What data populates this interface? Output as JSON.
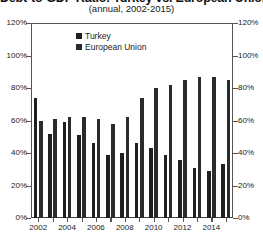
{
  "chart_data": {
    "type": "bar",
    "title": "Debt-to-GDP Ratio: Turkey vs. European Union",
    "subtitle": "(annual, 2002-2015)",
    "xlabel": "",
    "ylabel": "",
    "ylim": [
      0,
      120
    ],
    "ytick_labels": [
      "0%",
      "20%",
      "40%",
      "60%",
      "80%",
      "100%",
      "120%"
    ],
    "ytick_values": [
      0,
      20,
      40,
      60,
      80,
      100,
      120
    ],
    "ytick_labels_right": [
      "0%",
      "20%",
      "40%",
      "60%",
      "80%",
      "100%",
      "120%"
    ],
    "dual_axis": true,
    "grid": false,
    "legend_position": "top-center-inside",
    "categories": [
      "2002",
      "2003",
      "2004",
      "2005",
      "2006",
      "2007",
      "2008",
      "2009",
      "2010",
      "2011",
      "2012",
      "2013",
      "2014",
      "2015"
    ],
    "xtick_labels": [
      "2002",
      "2004",
      "2006",
      "2008",
      "2010",
      "2012",
      "2014"
    ],
    "series": [
      {
        "name": "Turkey",
        "color": "#1f1f1f",
        "values": [
          74,
          52,
          59,
          51,
          46,
          39,
          40,
          46,
          43,
          39,
          36,
          31,
          29,
          33
        ]
      },
      {
        "name": "European Union",
        "color": "#2b2b2b",
        "values": [
          60,
          61,
          62,
          62,
          61,
          58,
          62,
          74,
          80,
          82,
          85,
          87,
          87,
          85
        ]
      }
    ]
  },
  "legend": {
    "items": [
      {
        "label": "Turkey",
        "color": "#1f1f1f"
      },
      {
        "label": "European Union",
        "color": "#2b2b2b"
      }
    ]
  }
}
